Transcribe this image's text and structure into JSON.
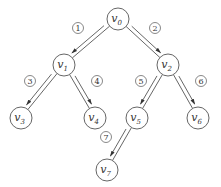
{
  "diagram": {
    "type": "binary-tree-traversal",
    "nodes": [
      {
        "id": "v0",
        "base": "v",
        "sub": "0",
        "x": 118,
        "y": 19
      },
      {
        "id": "v1",
        "base": "v",
        "sub": "1",
        "x": 64,
        "y": 65
      },
      {
        "id": "v2",
        "base": "v",
        "sub": "2",
        "x": 168,
        "y": 65
      },
      {
        "id": "v3",
        "base": "v",
        "sub": "3",
        "x": 21,
        "y": 118
      },
      {
        "id": "v4",
        "base": "v",
        "sub": "4",
        "x": 95,
        "y": 118
      },
      {
        "id": "v5",
        "base": "v",
        "sub": "5",
        "x": 137,
        "y": 118
      },
      {
        "id": "v6",
        "base": "v",
        "sub": "6",
        "x": 198,
        "y": 118
      },
      {
        "id": "v7",
        "base": "v",
        "sub": "7",
        "x": 107,
        "y": 170
      }
    ],
    "edges": [
      {
        "from": "v0",
        "to": "v1",
        "step": "1",
        "side": "left",
        "label_x": 78,
        "label_y": 28
      },
      {
        "from": "v0",
        "to": "v2",
        "step": "2",
        "side": "right",
        "label_x": 155,
        "label_y": 28
      },
      {
        "from": "v1",
        "to": "v3",
        "step": "3",
        "side": "left",
        "label_x": 30,
        "label_y": 81
      },
      {
        "from": "v1",
        "to": "v4",
        "step": "4",
        "side": "right",
        "label_x": 97,
        "label_y": 81
      },
      {
        "from": "v2",
        "to": "v5",
        "step": "5",
        "side": "left",
        "label_x": 141,
        "label_y": 81
      },
      {
        "from": "v2",
        "to": "v6",
        "step": "6",
        "side": "right",
        "label_x": 201,
        "label_y": 81
      },
      {
        "from": "v5",
        "to": "v7",
        "step": "7",
        "side": "left",
        "label_x": 106,
        "label_y": 137
      }
    ],
    "node_radius": 11,
    "step_radius": 5.5,
    "colors": {
      "stroke": "#555555",
      "text": "#333333",
      "background": "#ffffff"
    }
  }
}
